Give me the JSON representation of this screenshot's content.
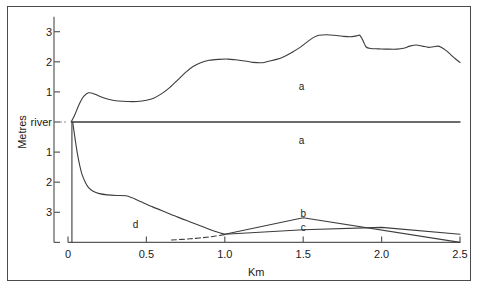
{
  "chart_data": {
    "type": "line",
    "title": "",
    "xlabel": "Km",
    "ylabel": "Metres",
    "xlim": [
      0,
      2.5
    ],
    "ylim": [
      -4,
      3.5
    ],
    "grid": false,
    "legend_position": "inline-annotations",
    "xticks": [
      {
        "value": 0,
        "label": "0"
      },
      {
        "value": 0.5,
        "label": "0.5"
      },
      {
        "value": 1.0,
        "label": "1.0"
      },
      {
        "value": 1.5,
        "label": "1.5"
      },
      {
        "value": 2.0,
        "label": "2.0"
      },
      {
        "value": 2.5,
        "label": "2.5"
      }
    ],
    "yticks": [
      {
        "value": 3,
        "label": "3"
      },
      {
        "value": 2,
        "label": "2"
      },
      {
        "value": 1,
        "label": "1"
      },
      {
        "value": 0,
        "label": "river"
      },
      {
        "value": -1,
        "label": "1"
      },
      {
        "value": -2,
        "label": "2"
      },
      {
        "value": -3,
        "label": "3"
      },
      {
        "value": -4,
        "label": ""
      }
    ],
    "annotations": [
      {
        "text": "a",
        "x": 1.49,
        "y": 1.2
      },
      {
        "text": "a",
        "x": 1.49,
        "y": -0.6
      },
      {
        "text": "b",
        "x": 1.5,
        "y": -3.02
      },
      {
        "text": "c",
        "x": 1.5,
        "y": -3.48
      },
      {
        "text": "d",
        "x": 0.43,
        "y": -3.38
      }
    ],
    "series": [
      {
        "name": "a-upper-bank-profile",
        "style": "solid",
        "points": [
          [
            0.02,
            0.0
          ],
          [
            0.04,
            0.2
          ],
          [
            0.06,
            0.45
          ],
          [
            0.08,
            0.68
          ],
          [
            0.1,
            0.85
          ],
          [
            0.13,
            0.97
          ],
          [
            0.16,
            0.95
          ],
          [
            0.19,
            0.88
          ],
          [
            0.23,
            0.8
          ],
          [
            0.27,
            0.74
          ],
          [
            0.32,
            0.7
          ],
          [
            0.38,
            0.68
          ],
          [
            0.44,
            0.68
          ],
          [
            0.5,
            0.72
          ],
          [
            0.55,
            0.8
          ],
          [
            0.6,
            0.95
          ],
          [
            0.65,
            1.15
          ],
          [
            0.7,
            1.4
          ],
          [
            0.75,
            1.65
          ],
          [
            0.8,
            1.85
          ],
          [
            0.85,
            1.98
          ],
          [
            0.9,
            2.05
          ],
          [
            0.96,
            2.08
          ],
          [
            1.02,
            2.09
          ],
          [
            1.08,
            2.06
          ],
          [
            1.14,
            2.02
          ],
          [
            1.18,
            1.98
          ],
          [
            1.24,
            1.97
          ],
          [
            1.28,
            2.02
          ],
          [
            1.33,
            2.08
          ],
          [
            1.38,
            2.18
          ],
          [
            1.43,
            2.32
          ],
          [
            1.48,
            2.48
          ],
          [
            1.53,
            2.68
          ],
          [
            1.57,
            2.82
          ],
          [
            1.6,
            2.88
          ],
          [
            1.65,
            2.9
          ],
          [
            1.7,
            2.88
          ],
          [
            1.75,
            2.85
          ],
          [
            1.8,
            2.83
          ],
          [
            1.84,
            2.86
          ],
          [
            1.86,
            2.88
          ],
          [
            1.88,
            2.72
          ],
          [
            1.9,
            2.5
          ],
          [
            1.93,
            2.44
          ],
          [
            1.98,
            2.43
          ],
          [
            2.04,
            2.42
          ],
          [
            2.1,
            2.42
          ],
          [
            2.14,
            2.45
          ],
          [
            2.18,
            2.52
          ],
          [
            2.22,
            2.56
          ],
          [
            2.26,
            2.52
          ],
          [
            2.3,
            2.48
          ],
          [
            2.33,
            2.5
          ],
          [
            2.36,
            2.52
          ],
          [
            2.38,
            2.48
          ],
          [
            2.41,
            2.38
          ],
          [
            2.44,
            2.24
          ],
          [
            2.47,
            2.1
          ],
          [
            2.5,
            1.98
          ]
        ]
      },
      {
        "name": "river-surface-line",
        "style": "solid",
        "points": [
          [
            0.025,
            0.0
          ],
          [
            2.5,
            0.0
          ]
        ]
      },
      {
        "name": "left-bank-vertical",
        "style": "solid",
        "points": [
          [
            0.025,
            0.0
          ],
          [
            0.025,
            -4.0
          ]
        ]
      },
      {
        "name": "d-channel-bed-profile",
        "style": "solid",
        "points": [
          [
            0.03,
            0.0
          ],
          [
            0.045,
            -0.55
          ],
          [
            0.06,
            -1.05
          ],
          [
            0.075,
            -1.45
          ],
          [
            0.09,
            -1.75
          ],
          [
            0.11,
            -2.0
          ],
          [
            0.13,
            -2.17
          ],
          [
            0.16,
            -2.3
          ],
          [
            0.2,
            -2.38
          ],
          [
            0.25,
            -2.42
          ],
          [
            0.31,
            -2.44
          ],
          [
            0.37,
            -2.45
          ],
          [
            0.41,
            -2.52
          ],
          [
            0.47,
            -2.66
          ],
          [
            0.54,
            -2.82
          ],
          [
            0.62,
            -2.99
          ],
          [
            0.7,
            -3.16
          ],
          [
            0.78,
            -3.32
          ],
          [
            0.86,
            -3.48
          ],
          [
            0.93,
            -3.62
          ],
          [
            0.98,
            -3.7
          ],
          [
            1.0,
            -3.73
          ]
        ]
      },
      {
        "name": "dashed-former-bed-trace",
        "style": "dashed",
        "points": [
          [
            0.66,
            -3.92
          ],
          [
            0.78,
            -3.88
          ],
          [
            0.9,
            -3.82
          ],
          [
            1.0,
            -3.74
          ]
        ]
      },
      {
        "name": "b-upper-deposit-profile",
        "style": "solid",
        "points": [
          [
            1.0,
            -3.73
          ],
          [
            1.5,
            -3.18
          ],
          [
            2.5,
            -4.0
          ]
        ]
      },
      {
        "name": "c-lower-deposit-profile",
        "style": "solid",
        "points": [
          [
            1.0,
            -3.73
          ],
          [
            1.5,
            -3.58
          ],
          [
            2.0,
            -3.5
          ],
          [
            2.5,
            -3.73
          ]
        ]
      }
    ]
  }
}
